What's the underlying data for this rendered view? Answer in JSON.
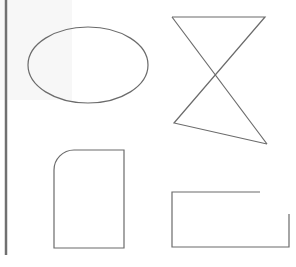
{
  "diagram": {
    "title": "",
    "stroke_color": "#6b6b6b",
    "bar_color": "#707070",
    "background": "#ffffff",
    "shapes": [
      {
        "id": "ellipse",
        "kind": "ellipse",
        "label": ""
      },
      {
        "id": "hourglass",
        "kind": "polyline",
        "label": ""
      },
      {
        "id": "rounded-rect",
        "kind": "rounded-rectangle",
        "label": ""
      },
      {
        "id": "open-rect",
        "kind": "open-rectangle",
        "label": ""
      }
    ]
  }
}
